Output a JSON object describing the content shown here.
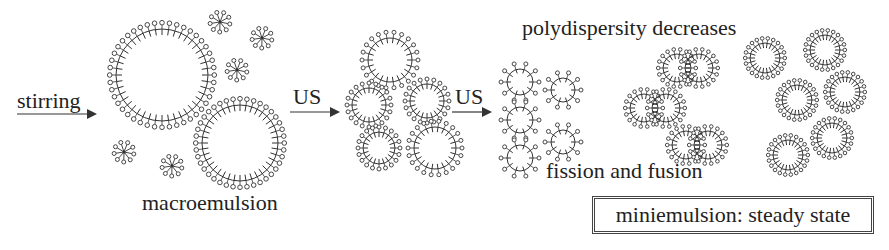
{
  "labels": {
    "stirring": "stirring",
    "us1": "US",
    "us2": "US",
    "macroemulsion": "macroemulsion",
    "polydispersity": "polydispersity decreases",
    "fission": "fission and fusion",
    "steady_state": "miniemulsion: steady state"
  },
  "colors": {
    "ink": "#222222",
    "background": "#ffffff"
  },
  "stages": [
    {
      "name": "macroemulsion",
      "description": "large droplets and free surfactant micelles"
    },
    {
      "name": "after first US",
      "description": "medium droplets"
    },
    {
      "name": "after second US",
      "description": "small droplets, fission and fusion"
    },
    {
      "name": "miniemulsion",
      "description": "uniform droplets at steady state"
    }
  ]
}
